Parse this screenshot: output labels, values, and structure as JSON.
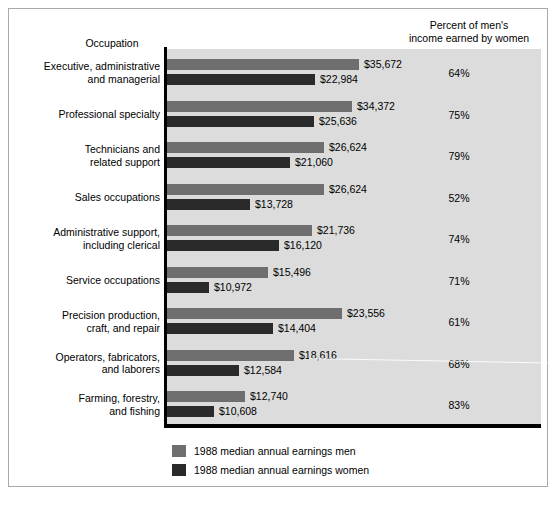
{
  "headers": {
    "occupation": "Occupation",
    "percent": "Percent of men's\nincome earned by women"
  },
  "colors": {
    "men_bar": "#6e6e6e",
    "women_bar": "#2a2a2a",
    "plot_background": "#dcdcdc",
    "axis": "#000000",
    "frame_border": "#a9a9a9"
  },
  "legend": [
    {
      "label": "1988 median annual earnings men",
      "color": "#6e6e6e",
      "swatch": "men-swatch"
    },
    {
      "label": "1988 median annual earnings women",
      "color": "#2a2a2a",
      "swatch": "women-swatch"
    }
  ],
  "chart_data": {
    "type": "bar",
    "title": "",
    "xlabel": "",
    "ylabel": "Occupation",
    "orientation": "horizontal",
    "grid": false,
    "legend_position": "bottom-left",
    "axis_range_note": "no numeric x-axis ticks shown; bar lengths annotated with dollar values",
    "categories": [
      "Executive, administrative\nand managerial",
      "Professional specialty",
      "Technicians and\nrelated support",
      "Sales occupations",
      "Administrative support,\nincluding clerical",
      "Service occupations",
      "Precision production,\ncraft, and repair",
      "Operators, fabricators,\nand laborers",
      "Farming, forestry,\nand fishing"
    ],
    "series": [
      {
        "name": "1988 median annual earnings men",
        "color": "#6e6e6e",
        "values": [
          35672,
          34372,
          26624,
          26624,
          21736,
          15496,
          23556,
          18616,
          12740
        ],
        "labels": [
          "$35,672",
          "$34,372",
          "$26,624",
          "$26,624",
          "$21,736",
          "$15,496",
          "$23,556",
          "$18,616",
          "$12,740"
        ],
        "bar_px": [
          192,
          185,
          157,
          157,
          145,
          101,
          175,
          127,
          78
        ]
      },
      {
        "name": "1988 median annual earnings women",
        "color": "#2a2a2a",
        "values": [
          22984,
          25636,
          21060,
          13728,
          16120,
          10972,
          14404,
          12584,
          10608
        ],
        "labels": [
          "$22,984",
          "$25,636",
          "$21,060",
          "$13,728",
          "$16,120",
          "$10,972",
          "$14,404",
          "$12,584",
          "$10,608"
        ],
        "bar_px": [
          148,
          147,
          123,
          83,
          112,
          42,
          106,
          72,
          47
        ]
      }
    ],
    "percent_of_mens_income": [
      "64%",
      "75%",
      "79%",
      "52%",
      "74%",
      "71%",
      "61%",
      "68%",
      "83%"
    ]
  }
}
